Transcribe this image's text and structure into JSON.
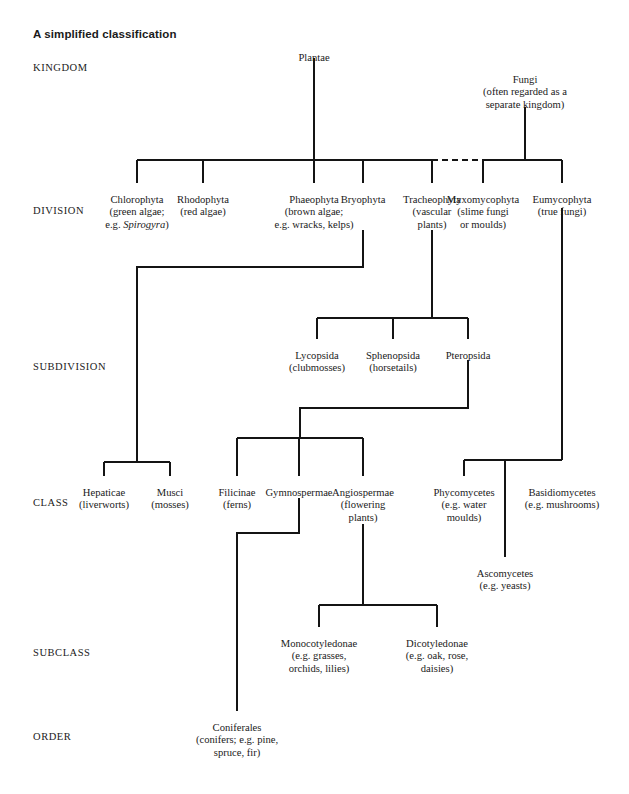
{
  "title": "A simplified classification",
  "ranks": [
    {
      "name": "KINGDOM",
      "label": "KINGDOM",
      "x": 33,
      "y": 62
    },
    {
      "name": "DIVISION",
      "label": "DIVISION",
      "x": 33,
      "y": 205
    },
    {
      "name": "SUBDIVISION",
      "label": "SUBDIVISION",
      "x": 33,
      "y": 361
    },
    {
      "name": "CLASS",
      "label": "CLASS",
      "x": 33,
      "y": 497
    },
    {
      "name": "SUBCLASS",
      "label": "SUBCLASS",
      "x": 33,
      "y": 647
    },
    {
      "name": "ORDER",
      "label": "ORDER",
      "x": 33,
      "y": 731
    }
  ],
  "nodes": [
    {
      "name": "plantae",
      "x": 314,
      "y": 52,
      "lines": [
        "Plantae"
      ]
    },
    {
      "name": "fungi",
      "x": 525,
      "y": 74,
      "lines": [
        "Fungi",
        "(often regarded as a",
        "separate kingdom)"
      ]
    },
    {
      "name": "chlorophyta",
      "x": 137,
      "y": 194,
      "lines": [
        "Chlorophyta",
        "(green algae;",
        "e.g. {i}Spirogyra{/i})"
      ]
    },
    {
      "name": "rhodophyta",
      "x": 203,
      "y": 194,
      "lines": [
        "Rhodophyta",
        "(red algae)"
      ]
    },
    {
      "name": "phaeophyta",
      "x": 314,
      "y": 194,
      "lines": [
        "Phaeophyta",
        "(brown algae;",
        "e.g. wracks, kelps)"
      ]
    },
    {
      "name": "bryophyta",
      "x": 363,
      "y": 194,
      "lines": [
        "Bryophyta"
      ]
    },
    {
      "name": "tracheophyta",
      "x": 432,
      "y": 194,
      "lines": [
        "Tracheophyta",
        "(vascular",
        "plants)"
      ]
    },
    {
      "name": "myxomycophyta",
      "x": 483,
      "y": 194,
      "lines": [
        "Myxomycophyta",
        "(slime fungi",
        "or moulds)"
      ]
    },
    {
      "name": "eumycophyta",
      "x": 562,
      "y": 194,
      "lines": [
        "Eumycophyta",
        "(true fungi)"
      ]
    },
    {
      "name": "lycopsida",
      "x": 317,
      "y": 350,
      "lines": [
        "Lycopsida",
        "(clubmosses)"
      ]
    },
    {
      "name": "sphenopsida",
      "x": 393,
      "y": 350,
      "lines": [
        "Sphenopsida",
        "(horsetails)"
      ]
    },
    {
      "name": "pteropsida",
      "x": 468,
      "y": 350,
      "lines": [
        "Pteropsida"
      ]
    },
    {
      "name": "hepaticae",
      "x": 104,
      "y": 487,
      "lines": [
        "Hepaticae",
        "(liverworts)"
      ]
    },
    {
      "name": "musci",
      "x": 170,
      "y": 487,
      "lines": [
        "Musci",
        "(mosses)"
      ]
    },
    {
      "name": "filicinae",
      "x": 237,
      "y": 487,
      "lines": [
        "Filicinae",
        "(ferns)"
      ]
    },
    {
      "name": "gymnospermae",
      "x": 299,
      "y": 487,
      "lines": [
        "Gymnospermae"
      ]
    },
    {
      "name": "angiospermae",
      "x": 363,
      "y": 487,
      "lines": [
        "Angiospermae",
        "(flowering",
        "plants)"
      ]
    },
    {
      "name": "phycomycetes",
      "x": 464,
      "y": 487,
      "lines": [
        "Phycomycetes",
        "(e.g. water",
        "moulds)"
      ]
    },
    {
      "name": "basidiomycetes",
      "x": 562,
      "y": 487,
      "lines": [
        "Basidiomycetes",
        "(e.g. mushrooms)"
      ]
    },
    {
      "name": "ascomycetes",
      "x": 505,
      "y": 568,
      "lines": [
        "Ascomycetes",
        "(e.g. yeasts)"
      ]
    },
    {
      "name": "monocotyledonae",
      "x": 319,
      "y": 638,
      "lines": [
        "Monocotyledonae",
        "(e.g. grasses,",
        "orchids, lilies)"
      ]
    },
    {
      "name": "dicotyledonae",
      "x": 437,
      "y": 638,
      "lines": [
        "Dicotyledonae",
        "(e.g. oak, rose,",
        "daisies)"
      ]
    },
    {
      "name": "coniferales",
      "x": 237,
      "y": 722,
      "lines": [
        "Coniferales",
        "(conifers; e.g. pine,",
        "spruce, fir)"
      ]
    }
  ],
  "edges": [
    {
      "name": "plantae-stem",
      "d": "M 314 58 L 314 160",
      "dashed": false
    },
    {
      "name": "fungi-stem",
      "d": "M 525 107 L 525 160",
      "dashed": false
    },
    {
      "name": "kingdom-bar-plants",
      "d": "M 137 160 L 432 160",
      "dashed": false
    },
    {
      "name": "kingdom-bar-gap",
      "d": "M 432 160 L 483 160",
      "dashed": true
    },
    {
      "name": "kingdom-bar-fungi",
      "d": "M 483 160 L 562 160",
      "dashed": false
    },
    {
      "name": "chlorophyta-drop",
      "d": "M 137 160 L 137 183",
      "dashed": false
    },
    {
      "name": "rhodophyta-drop",
      "d": "M 203 160 L 203 183",
      "dashed": false
    },
    {
      "name": "phaeophyta-drop",
      "d": "M 314 160 L 314 183",
      "dashed": false
    },
    {
      "name": "bryophyta-drop",
      "d": "M 363 160 L 363 183",
      "dashed": false
    },
    {
      "name": "tracheophyta-drop",
      "d": "M 432 160 L 432 183",
      "dashed": false
    },
    {
      "name": "myxomycophyta-drop",
      "d": "M 483 160 L 483 183",
      "dashed": false
    },
    {
      "name": "eumycophyta-drop",
      "d": "M 562 160 L 562 183",
      "dashed": false
    },
    {
      "name": "bryophyta-to-class",
      "d": "M 363 230 L 363 267 L 137 267 L 137 462",
      "dashed": false
    },
    {
      "name": "bryophyta-class-bar",
      "d": "M 104 462 L 170 462",
      "dashed": false
    },
    {
      "name": "hepaticae-drop",
      "d": "M 104 462 L 104 476",
      "dashed": false
    },
    {
      "name": "musci-drop",
      "d": "M 170 462 L 170 476",
      "dashed": false
    },
    {
      "name": "tracheophyta-to-subdiv",
      "d": "M 432 230 L 432 318",
      "dashed": false
    },
    {
      "name": "subdivision-bar",
      "d": "M 317 318 L 468 318",
      "dashed": false
    },
    {
      "name": "lycopsida-drop",
      "d": "M 317 318 L 317 339",
      "dashed": false
    },
    {
      "name": "sphenopsida-drop",
      "d": "M 393 318 L 393 339",
      "dashed": false
    },
    {
      "name": "pteropsida-drop",
      "d": "M 468 318 L 468 339",
      "dashed": false
    },
    {
      "name": "pteropsida-to-class",
      "d": "M 468 360 L 468 408 L 300 408 L 300 438",
      "dashed": false
    },
    {
      "name": "plant-class-bar",
      "d": "M 237 438 L 363 438",
      "dashed": false
    },
    {
      "name": "filicinae-drop",
      "d": "M 237 438 L 237 476",
      "dashed": false
    },
    {
      "name": "gymnospermae-drop",
      "d": "M 299 438 L 299 476",
      "dashed": false
    },
    {
      "name": "angiospermae-drop",
      "d": "M 363 438 L 363 476",
      "dashed": false
    },
    {
      "name": "eumycophyta-to-class",
      "d": "M 562 208 L 562 460",
      "dashed": false
    },
    {
      "name": "fungi-class-bar",
      "d": "M 464 460 L 562 460",
      "dashed": false
    },
    {
      "name": "phycomycetes-drop",
      "d": "M 464 460 L 464 476",
      "dashed": false
    },
    {
      "name": "ascomycetes-drop",
      "d": "M 505 460 L 505 557",
      "dashed": false
    },
    {
      "name": "gymnospermae-to-order",
      "d": "M 299 498 L 299 533 L 237 533 L 237 711",
      "dashed": false
    },
    {
      "name": "angiospermae-to-subclass",
      "d": "M 363 524 L 363 605",
      "dashed": false
    },
    {
      "name": "subclass-bar",
      "d": "M 319 605 L 437 605",
      "dashed": false
    },
    {
      "name": "monocotyledonae-drop",
      "d": "M 319 605 L 319 627",
      "dashed": false
    },
    {
      "name": "dicotyledonae-drop",
      "d": "M 437 605 L 437 627",
      "dashed": false
    }
  ]
}
